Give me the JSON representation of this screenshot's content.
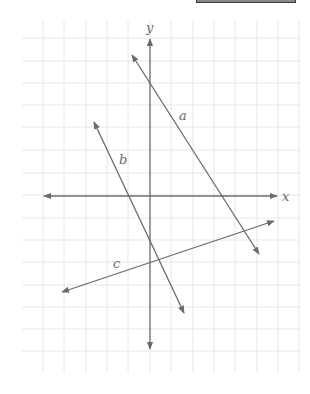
{
  "figure": {
    "axes": {
      "x_label": "x",
      "y_label": "y"
    },
    "lines": [
      {
        "label": "a",
        "from": [
          132,
          55
        ],
        "to": [
          259,
          254
        ],
        "label_pos": [
          179,
          120
        ]
      },
      {
        "label": "b",
        "from": [
          94,
          122
        ],
        "to": [
          184,
          313
        ],
        "label_pos": [
          119,
          164
        ]
      },
      {
        "label": "c",
        "from": [
          62,
          292
        ],
        "to": [
          274,
          221
        ],
        "label_pos": [
          113,
          268
        ]
      }
    ],
    "grid": {
      "x_lines": [
        43,
        64,
        86,
        107,
        128,
        150,
        171,
        193,
        214,
        235,
        257,
        278,
        299
      ],
      "y_lines": [
        38,
        61,
        83,
        105,
        127,
        150,
        173,
        195,
        218,
        240,
        262,
        285,
        307,
        329,
        351
      ],
      "x_range": [
        22,
        300
      ],
      "y_range": [
        20,
        373
      ]
    },
    "colors": {
      "grid": "#e6e6e6",
      "ink": "#6a6a6a",
      "top_box": "#8a8a8a"
    }
  }
}
